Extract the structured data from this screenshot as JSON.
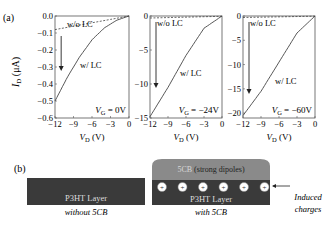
{
  "panel_a": {
    "label": "(a)",
    "ylabel": "I",
    "ylabel_sub": "D",
    "ylabel_unit": " (μA)",
    "xlabel": "V",
    "xlabel_sub": "D",
    "xlabel_unit": " (V)",
    "curve_label_without": "w/o LC",
    "curve_label_with": "w/ LC"
  },
  "panel_b": {
    "label": "(b)",
    "left_layer": "P3HT Layer",
    "left_caption": "without 5CB",
    "right_layer": "P3HT Layer",
    "right_caption": "with 5CB",
    "lc_label_a": "5CB",
    "lc_label_b": " (strong dipoles)",
    "charge_symbol": "+",
    "charge_count": 6,
    "annotation_line1": "Induced",
    "annotation_line2": "charges",
    "colors": {
      "p3ht": "#3a3a3a",
      "lc": "#8a8a8a",
      "charge_fill": "#ffffff"
    }
  },
  "chart_data": [
    {
      "type": "line",
      "title": "V_G = 0V",
      "xlabel": "V_D (V)",
      "ylabel": "I_D (μA)",
      "xlim": [
        -12,
        0
      ],
      "ylim": [
        -0.6,
        0.0
      ],
      "xticks": [
        -12,
        -9,
        -6,
        -3,
        0
      ],
      "yticks": [
        0.0,
        -0.1,
        -0.2,
        -0.3,
        -0.4,
        -0.5,
        -0.6
      ],
      "ytick_labels": [
        "0.0",
        "−0.1",
        "−0.2",
        "−0.3",
        "−0.4",
        "−0.5",
        "−0.6"
      ],
      "series": [
        {
          "name": "w/o LC",
          "style": "dashed",
          "x": [
            -12,
            -9,
            -6,
            -3,
            0
          ],
          "y": [
            -0.08,
            -0.06,
            -0.04,
            -0.02,
            0.0
          ]
        },
        {
          "name": "w/ LC",
          "style": "solid",
          "x": [
            -12,
            -10,
            -8,
            -6,
            -4,
            -2,
            0
          ],
          "y": [
            -0.5,
            -0.36,
            -0.24,
            -0.14,
            -0.07,
            -0.025,
            0.0
          ]
        }
      ],
      "annotations": [
        "arrow from w/o LC to w/ LC at V_D≈-11"
      ]
    },
    {
      "type": "line",
      "title": "V_G = −24V",
      "xlabel": "V_D (V)",
      "ylabel": "I_D (μA)",
      "xlim": [
        -12,
        0
      ],
      "ylim": [
        -15,
        0
      ],
      "xticks": [
        -12,
        -9,
        -6,
        -3,
        0
      ],
      "yticks": [
        0,
        -5,
        -10,
        -15
      ],
      "ytick_labels": [
        "0",
        "−5",
        "−10",
        "−15"
      ],
      "series": [
        {
          "name": "w/o LC",
          "style": "dashed",
          "x": [
            -12,
            0
          ],
          "y": [
            -0.3,
            -0.05
          ]
        },
        {
          "name": "w/ LC",
          "style": "solid",
          "x": [
            -12,
            -9,
            -6,
            -3,
            0
          ],
          "y": [
            -14.8,
            -10.5,
            -5.8,
            -1.8,
            0.0
          ]
        }
      ]
    },
    {
      "type": "line",
      "title": "V_G = −60V",
      "xlabel": "V_D (V)",
      "ylabel": "I_D (μA)",
      "xlim": [
        -12,
        0
      ],
      "ylim": [
        -21,
        0
      ],
      "xticks": [
        -12,
        -9,
        -6,
        -3,
        0
      ],
      "yticks": [
        0,
        -5,
        -10,
        -15,
        -20
      ],
      "ytick_labels": [
        "0",
        "−5",
        "−10",
        "−15",
        "−20"
      ],
      "series": [
        {
          "name": "w/o LC",
          "style": "dashed",
          "x": [
            -12,
            0
          ],
          "y": [
            -0.3,
            -0.05
          ]
        },
        {
          "name": "w/ LC",
          "style": "solid",
          "x": [
            -12,
            -9,
            -6,
            -3,
            0
          ],
          "y": [
            -20.5,
            -15.5,
            -9.5,
            -3.5,
            0.0
          ]
        }
      ]
    }
  ]
}
